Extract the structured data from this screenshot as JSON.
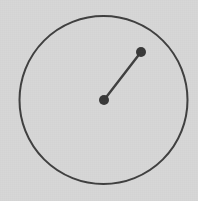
{
  "figure": {
    "background_color": "#d6d6d6",
    "stroke_color": "#3f3f3f",
    "point_color": "#383838",
    "canvas": {
      "width": 198,
      "height": 201
    }
  },
  "chart_data": {
    "type": "scatter",
    "title": "",
    "xlabel": "",
    "ylabel": "",
    "xlim": [
      0,
      198
    ],
    "ylim": [
      0,
      201
    ],
    "grid": false,
    "legend": "none",
    "shapes": [
      {
        "kind": "circle",
        "name": "outer-circle",
        "cx": 103.5,
        "cy": 100,
        "r": 84,
        "fill": "none",
        "stroke": "#3f3f3f",
        "stroke_width": 2
      },
      {
        "kind": "line",
        "name": "radius-segment",
        "x1": 104,
        "y1": 100,
        "x2": 141,
        "y2": 52,
        "stroke": "#3f3f3f",
        "stroke_width": 2.4
      }
    ],
    "points": [
      {
        "name": "center-point",
        "x": 104,
        "y": 100,
        "r": 5,
        "color": "#383838"
      },
      {
        "name": "interior-point",
        "x": 141,
        "y": 52,
        "r": 5,
        "color": "#383838"
      }
    ]
  }
}
